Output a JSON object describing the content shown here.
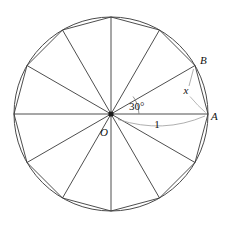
{
  "figure": {
    "type": "geometry-diagram",
    "circle": {
      "center": {
        "x": 111,
        "y": 114
      },
      "radius_px": 97,
      "radius_value": "1"
    },
    "polygon": {
      "sides": 12,
      "name": "regular dodecagon",
      "central_angle_deg": 30
    },
    "colors": {
      "stroke": "#3a3a3a",
      "circle": "#555555",
      "annotation": "#8c8c8c",
      "background": "#ffffff",
      "text": "#111111"
    },
    "labels": {
      "center": "O",
      "point_a": "A",
      "point_b": "B",
      "angle": "30°",
      "radius": "1",
      "chord": "x"
    },
    "label_positions": {
      "center": {
        "x": 104,
        "y": 136
      },
      "point_a": {
        "x": 210,
        "y": 120
      },
      "point_b": {
        "x": 199,
        "y": 63
      },
      "angle": {
        "x": 129,
        "y": 110
      },
      "radius": {
        "x": 155,
        "y": 127
      },
      "chord": {
        "x": 186,
        "y": 93
      }
    },
    "vertices_deg": [
      0,
      30,
      60,
      90,
      120,
      150,
      180,
      210,
      240,
      270,
      300,
      330
    ]
  }
}
